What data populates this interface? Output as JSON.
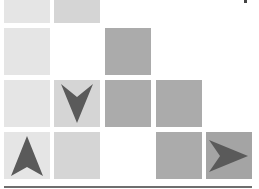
{
  "board": {
    "columns": 5,
    "colors": {
      "light": "#e5e5e5",
      "medium": "#d5d5d5",
      "dark": "#ababab",
      "arrow": "#5a5a5a",
      "baseline": "#6e6e6e"
    },
    "tiles": [
      {
        "row": 0,
        "col": 0,
        "shade": "light",
        "arrow": null
      },
      {
        "row": 0,
        "col": 1,
        "shade": "medium",
        "arrow": null
      },
      {
        "row": 1,
        "col": 0,
        "shade": "light",
        "arrow": null
      },
      {
        "row": 1,
        "col": 2,
        "shade": "dark",
        "arrow": null
      },
      {
        "row": 2,
        "col": 0,
        "shade": "light",
        "arrow": null
      },
      {
        "row": 2,
        "col": 1,
        "shade": "medium",
        "arrow": "down"
      },
      {
        "row": 2,
        "col": 2,
        "shade": "dark",
        "arrow": null
      },
      {
        "row": 2,
        "col": 3,
        "shade": "dark",
        "arrow": null
      },
      {
        "row": 3,
        "col": 0,
        "shade": "light",
        "arrow": "up"
      },
      {
        "row": 3,
        "col": 1,
        "shade": "medium",
        "arrow": null
      },
      {
        "row": 3,
        "col": 3,
        "shade": "dark",
        "arrow": null
      },
      {
        "row": 3,
        "col": 4,
        "shade": "darker",
        "arrow": "right"
      }
    ]
  }
}
